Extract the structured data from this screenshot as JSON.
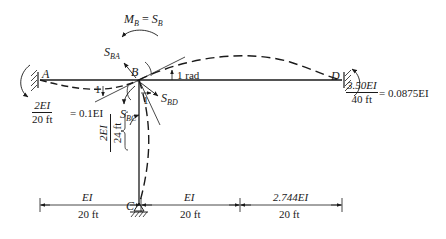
{
  "diagram": {
    "type": "moment-distribution-frame",
    "colors": {
      "ink": "#1a1a1a",
      "background": "#ffffff"
    },
    "joints": {
      "A": {
        "label": "A",
        "support": "fixed"
      },
      "B": {
        "label": "B",
        "support": "rigid-joint"
      },
      "C": {
        "label": "C",
        "support": "pin"
      },
      "D": {
        "label": "D",
        "support": "fixed"
      }
    },
    "moment_label": {
      "lhs": "M",
      "lhs_sub": "B",
      "eq": " = ",
      "rhs": "S",
      "rhs_sub": "B"
    },
    "stiffness_labels": {
      "S_BA": {
        "main": "S",
        "sub": "BA"
      },
      "S_BD": {
        "main": "S",
        "sub": "BD"
      },
      "S_BC": {
        "main": "S",
        "sub": "BC"
      }
    },
    "rotation_label": "1 rad",
    "unit_rotation_marks": [
      "1",
      "1"
    ],
    "stiffness_AB": {
      "numerator": "2EI",
      "denominator": "20 ft",
      "result": "= 0.1EI"
    },
    "stiffness_BD": {
      "numerator": "3.50EI",
      "denominator": "40 ft",
      "result": "= 0.0875EI"
    },
    "stiffness_BC": {
      "numerator": "2EI",
      "denominator": "24 ft"
    },
    "dimensions": [
      {
        "stiffness": "EI",
        "length": "20 ft"
      },
      {
        "stiffness": "EI",
        "length": "20 ft"
      },
      {
        "stiffness": "2.744EI",
        "length": "20 ft"
      }
    ]
  }
}
